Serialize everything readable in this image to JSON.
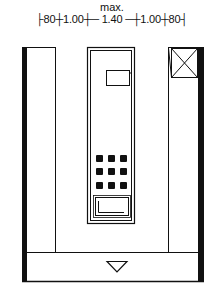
{
  "header": {
    "max_label": "max.",
    "dimension_line": "├80┼1.00┼─ 1.40 ─┼1.00┼80┤",
    "segments": [
      "80",
      "1.00",
      "1.40",
      "1.00",
      "80"
    ]
  },
  "plan": {
    "elements": [
      {
        "name": "left-wall",
        "type": "thick-wall"
      },
      {
        "name": "left-side-panel",
        "type": "panel"
      },
      {
        "name": "phone-booth",
        "type": "booth"
      },
      {
        "name": "display-screen",
        "type": "screen"
      },
      {
        "name": "keypad",
        "type": "keypad",
        "rows": 3,
        "cols": 3
      },
      {
        "name": "card-slot",
        "type": "slot"
      },
      {
        "name": "right-side-panel",
        "type": "panel"
      },
      {
        "name": "crossed-box",
        "type": "void-x"
      },
      {
        "name": "right-wall",
        "type": "thick-wall"
      },
      {
        "name": "entrance-strip",
        "type": "entrance"
      },
      {
        "name": "entrance-arrow",
        "type": "triangle-down"
      }
    ],
    "colors": {
      "line": "#111111",
      "background": "#ffffff"
    }
  }
}
